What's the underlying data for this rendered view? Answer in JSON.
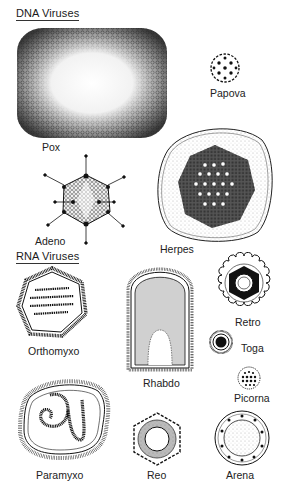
{
  "sections": {
    "dna": {
      "heading": "DNA Viruses"
    },
    "rna": {
      "heading": "RNA Viruses"
    }
  },
  "viruses": {
    "pox": {
      "label": "Pox",
      "group": "DNA"
    },
    "papova": {
      "label": "Papova",
      "group": "DNA"
    },
    "adeno": {
      "label": "Adeno",
      "group": "DNA"
    },
    "herpes": {
      "label": "Herpes",
      "group": "DNA"
    },
    "orthomyxo": {
      "label": "Orthomyxo",
      "group": "RNA"
    },
    "rhabdo": {
      "label": "Rhabdo",
      "group": "RNA"
    },
    "retro": {
      "label": "Retro",
      "group": "RNA"
    },
    "toga": {
      "label": "Toga",
      "group": "RNA"
    },
    "picorna": {
      "label": "Picorna",
      "group": "RNA"
    },
    "paramyxo": {
      "label": "Paramyxo",
      "group": "RNA"
    },
    "reo": {
      "label": "Reo",
      "group": "RNA"
    },
    "arena": {
      "label": "Arena",
      "group": "RNA"
    }
  },
  "colors": {
    "ink": "#1a1a1a",
    "paper": "#ffffff",
    "stipple": "#555555"
  }
}
